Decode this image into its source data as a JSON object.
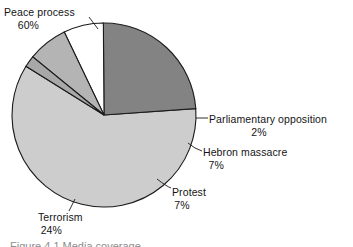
{
  "figure": {
    "background_color": "#ffffff",
    "outline_color": "#1a1a1a",
    "caption_partial": "Figure 4.1  Media coverage"
  },
  "chart_data": {
    "type": "pie",
    "title": "",
    "subtitle": "",
    "xlabel": "",
    "ylabel": "",
    "legend_position": "none",
    "grid": false,
    "labels_outside": true,
    "start_angle_deg": -4,
    "direction": "clockwise",
    "categories": [
      "Peace process",
      "Parliamentary opposition",
      "Hebron massacre",
      "Protest",
      "Terrorism"
    ],
    "values": [
      60,
      2,
      7,
      7,
      24
    ],
    "value_suffix": "%",
    "colors": [
      "#cdcdcd",
      "#a8a8a8",
      "#b4b4b4",
      "#ffffff",
      "#838383"
    ],
    "slices": [
      {
        "name": "Peace process",
        "value": 60,
        "value_text": "60%",
        "color": "#cdcdcd",
        "label_position": "top-left",
        "has_leader_line": true
      },
      {
        "name": "Parliamentary opposition",
        "value": 2,
        "value_text": "2%",
        "color": "#a8a8a8",
        "label_position": "right",
        "has_leader_line": true
      },
      {
        "name": "Hebron massacre",
        "value": 7,
        "value_text": "7%",
        "color": "#b4b4b4",
        "label_position": "right",
        "has_leader_line": true
      },
      {
        "name": "Protest",
        "value": 7,
        "value_text": "7%",
        "color": "#ffffff",
        "label_position": "bottom-right",
        "has_leader_line": true
      },
      {
        "name": "Terrorism",
        "value": 24,
        "value_text": "24%",
        "color": "#838383",
        "label_position": "bottom-left",
        "has_leader_line": true
      }
    ]
  }
}
